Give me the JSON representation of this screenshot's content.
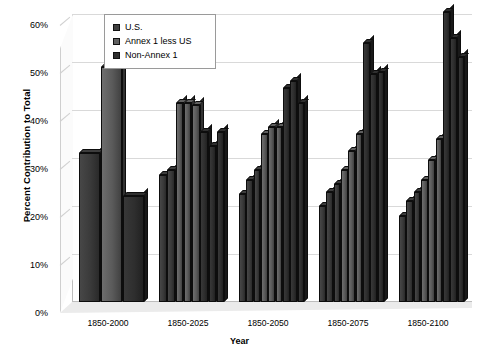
{
  "chart_data": {
    "type": "bar",
    "title": "",
    "xlabel": "Year",
    "ylabel": "Percent Contribution to Total",
    "ylim": [
      0,
      60
    ],
    "ytick_labels": [
      "0%",
      "10%",
      "20%",
      "30%",
      "40%",
      "50%",
      "60%"
    ],
    "ytick_values": [
      0,
      10,
      20,
      30,
      40,
      50,
      60
    ],
    "grid": true,
    "legend_position": "top-left-inside",
    "categories": [
      "1850-2000",
      "1850-2025",
      "1850-2050",
      "1850-2075",
      "1850-2100"
    ],
    "series": [
      {
        "name": "U.S.",
        "color": "#3a3a3a",
        "values_by_category": [
          [
            31.0
          ],
          [
            22.0,
            26.5,
            27.5
          ],
          [
            22.0,
            25.5,
            27.5
          ],
          [
            20.0,
            23.0,
            24.5
          ],
          [
            18.0,
            21.0,
            23.0
          ]
        ]
      },
      {
        "name": "Annex 1 less US",
        "color": "#5a5a5a",
        "values_by_category": [
          [
            49.0
          ],
          [
            41.5,
            41.5,
            41.0
          ],
          [
            35.0,
            36.5,
            41.0
          ],
          [
            27.5,
            31.5,
            35.0
          ],
          [
            25.5,
            29.5,
            34.0
          ]
        ]
      },
      {
        "name": "Non-Annex 1",
        "color": "#2e2e2e",
        "values_by_category": [
          [
            22.0
          ],
          [
            35.5,
            32.5,
            35.5
          ],
          [
            44.5,
            46.0,
            41.5
          ],
          [
            54.0,
            47.5,
            48.0
          ],
          [
            60.5,
            55.0,
            51.0
          ]
        ]
      }
    ],
    "bar_sequence": [
      {
        "category": "1850-2000",
        "bars": [
          {
            "series": "U.S.",
            "value": 31.0
          },
          {
            "series": "Annex 1 less US",
            "value": 49.0
          },
          {
            "series": "Non-Annex 1",
            "value": 22.0
          }
        ]
      },
      {
        "category": "1850-2025",
        "bars": [
          {
            "series": "U.S.",
            "value": 26.5
          },
          {
            "series": "U.S.",
            "value": 27.5
          },
          {
            "series": "Annex 1 less US",
            "value": 41.5
          },
          {
            "series": "Annex 1 less US",
            "value": 41.5
          },
          {
            "series": "Annex 1 less US",
            "value": 41.0
          },
          {
            "series": "Non-Annex 1",
            "value": 35.5
          },
          {
            "series": "Non-Annex 1",
            "value": 32.5
          },
          {
            "series": "Non-Annex 1",
            "value": 35.5
          }
        ]
      },
      {
        "category": "1850-2050",
        "bars": [
          {
            "series": "U.S.",
            "value": 22.5
          },
          {
            "series": "U.S.",
            "value": 25.5
          },
          {
            "series": "U.S.",
            "value": 27.5
          },
          {
            "series": "Annex 1 less US",
            "value": 35.0
          },
          {
            "series": "Annex 1 less US",
            "value": 36.5
          },
          {
            "series": "Annex 1 less US",
            "value": 36.5
          },
          {
            "series": "Non-Annex 1",
            "value": 44.5
          },
          {
            "series": "Non-Annex 1",
            "value": 46.0
          },
          {
            "series": "Non-Annex 1",
            "value": 41.5
          }
        ]
      },
      {
        "category": "1850-2075",
        "bars": [
          {
            "series": "U.S.",
            "value": 20.0
          },
          {
            "series": "U.S.",
            "value": 23.0
          },
          {
            "series": "U.S.",
            "value": 24.5
          },
          {
            "series": "Annex 1 less US",
            "value": 27.5
          },
          {
            "series": "Annex 1 less US",
            "value": 31.5
          },
          {
            "series": "Annex 1 less US",
            "value": 35.0
          },
          {
            "series": "Non-Annex 1",
            "value": 54.0
          },
          {
            "series": "Non-Annex 1",
            "value": 47.5
          },
          {
            "series": "Non-Annex 1",
            "value": 48.0
          }
        ]
      },
      {
        "category": "1850-2100",
        "bars": [
          {
            "series": "U.S.",
            "value": 18.0
          },
          {
            "series": "U.S.",
            "value": 21.0
          },
          {
            "series": "U.S.",
            "value": 23.0
          },
          {
            "series": "Annex 1 less US",
            "value": 25.5
          },
          {
            "series": "Annex 1 less US",
            "value": 29.5
          },
          {
            "series": "Annex 1 less US",
            "value": 34.0
          },
          {
            "series": "Non-Annex 1",
            "value": 60.5
          },
          {
            "series": "Non-Annex 1",
            "value": 55.0
          },
          {
            "series": "Non-Annex 1",
            "value": 51.0
          }
        ]
      }
    ]
  },
  "legend": {
    "items": [
      {
        "label": "U.S.",
        "color": "#3f3f3f"
      },
      {
        "label": "Annex 1 less US",
        "color": "#606060"
      },
      {
        "label": "Non-Annex 1",
        "color": "#2f2f2f"
      }
    ]
  },
  "axes": {
    "y_title": "Percent Contribution to Total",
    "x_title": "Year"
  }
}
